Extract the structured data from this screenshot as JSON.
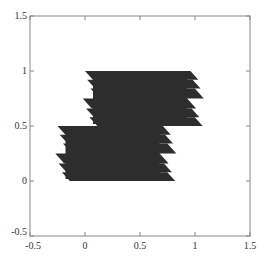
{
  "chart_data": {
    "type": "area",
    "title": "",
    "xlabel": "",
    "ylabel": "",
    "xlim": [
      -0.5,
      1.5
    ],
    "ylim": [
      -0.5,
      1.5
    ],
    "grid": false,
    "legend": null,
    "xticks": [
      -0.5,
      0,
      0.5,
      1,
      1.5
    ],
    "yticks": [
      -0.5,
      0,
      0.5,
      1,
      1.5
    ],
    "xtick_labels": [
      "-0.5",
      "0",
      "0.5",
      "1",
      "1.5"
    ],
    "ytick_labels": [
      "-0.5",
      "0",
      "0.5",
      "1",
      "1.5"
    ],
    "fill_color": "#2a2a2a",
    "regions": [
      {
        "name": "upper-block",
        "x_range": [
          0.0,
          1.0
        ],
        "y_range": [
          0.5,
          1.0
        ],
        "teeth": [
          {
            "y_top": 1.0,
            "y_bot": 0.92,
            "x_left": 0.0,
            "x_right": 1.03
          },
          {
            "y_top": 0.92,
            "y_bot": 0.84,
            "x_left": 0.02,
            "x_right": 1.05
          },
          {
            "y_top": 0.84,
            "y_bot": 0.75,
            "x_left": 0.05,
            "x_right": 1.08
          },
          {
            "y_top": 0.75,
            "y_bot": 0.66,
            "x_left": -0.02,
            "x_right": 1.01
          },
          {
            "y_top": 0.66,
            "y_bot": 0.58,
            "x_left": 0.01,
            "x_right": 1.04
          },
          {
            "y_top": 0.58,
            "y_bot": 0.5,
            "x_left": 0.04,
            "x_right": 1.07
          }
        ]
      },
      {
        "name": "lower-block",
        "x_range": [
          -0.25,
          0.75
        ],
        "y_range": [
          0.0,
          0.5
        ],
        "teeth": [
          {
            "y_top": 0.5,
            "y_bot": 0.42,
            "x_left": -0.25,
            "x_right": 0.78
          },
          {
            "y_top": 0.42,
            "y_bot": 0.34,
            "x_left": -0.23,
            "x_right": 0.8
          },
          {
            "y_top": 0.34,
            "y_bot": 0.25,
            "x_left": -0.2,
            "x_right": 0.83
          },
          {
            "y_top": 0.25,
            "y_bot": 0.16,
            "x_left": -0.27,
            "x_right": 0.76
          },
          {
            "y_top": 0.16,
            "y_bot": 0.08,
            "x_left": -0.24,
            "x_right": 0.79
          },
          {
            "y_top": 0.08,
            "y_bot": 0.0,
            "x_left": -0.21,
            "x_right": 0.82
          }
        ]
      }
    ]
  }
}
